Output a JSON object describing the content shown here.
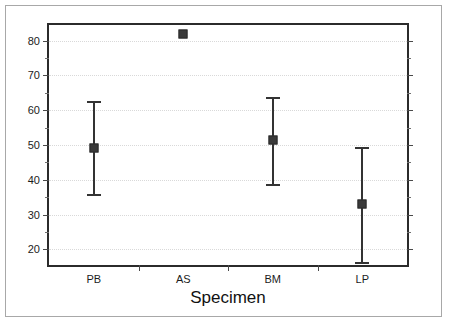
{
  "chart_data": {
    "type": "scatter",
    "title": "",
    "xlabel": "Specimen",
    "ylabel": "",
    "categories": [
      "PB",
      "AS",
      "BM",
      "LP"
    ],
    "values": [
      49.2,
      82.0,
      51.3,
      33.0
    ],
    "error_low": [
      35.8,
      null,
      38.8,
      16.3
    ],
    "error_high": [
      62.7,
      null,
      63.9,
      49.4
    ],
    "ylim": [
      15.5,
      84.5
    ],
    "yticks": [
      20,
      30,
      40,
      50,
      60,
      70,
      80
    ],
    "ytick_labels": [
      "20",
      "30",
      "40",
      "50",
      "60",
      "70",
      "80"
    ],
    "yticks_minor": [
      15,
      25,
      35,
      45,
      55,
      65,
      75
    ],
    "grid": true,
    "grid_axis": "y",
    "legend": "none",
    "marker_style": "filled-square",
    "series": [
      {
        "name": "mean with 95% interval",
        "points": [
          {
            "category": "PB",
            "value": 49.2,
            "low": 35.8,
            "high": 62.7
          },
          {
            "category": "AS",
            "value": 82.0,
            "low": null,
            "high": null
          },
          {
            "category": "BM",
            "value": 51.3,
            "low": 38.8,
            "high": 63.9
          },
          {
            "category": "LP",
            "value": 33.0,
            "low": 16.3,
            "high": 49.4
          }
        ]
      }
    ],
    "colors": {
      "marker": "#3a3a3a",
      "error_bar": "#333333",
      "axis": "#2b2b2b",
      "grid": "#d9d9d9",
      "frame": "#a8a8a8",
      "text": "#1c1c1c",
      "background": "#ffffff"
    }
  }
}
